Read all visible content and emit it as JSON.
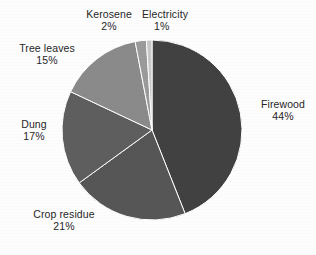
{
  "chart_data": {
    "type": "pie",
    "title": "",
    "subtitle": "",
    "xlabel": "",
    "ylabel": "",
    "legend_position": "none",
    "grid": false,
    "labels_outside": true,
    "unit": "%",
    "start_angle_deg": 0,
    "direction": "clockwise",
    "categories": [
      "Firewood",
      "Crop residue",
      "Dung",
      "Tree leaves",
      "Kerosene",
      "Electricity"
    ],
    "values": [
      44,
      21,
      17,
      15,
      2,
      1
    ],
    "slices": [
      {
        "label": "Firewood",
        "value": 44,
        "value_text": "44%",
        "color": "#414141"
      },
      {
        "label": "Crop residue",
        "value": 21,
        "value_text": "21%",
        "color": "#565656"
      },
      {
        "label": "Dung",
        "value": 17,
        "value_text": "17%",
        "color": "#5e5e5e"
      },
      {
        "label": "Tree leaves",
        "value": 15,
        "value_text": "15%",
        "color": "#8a8a8a"
      },
      {
        "label": "Kerosene",
        "value": 2,
        "value_text": "2%",
        "color": "#9a9a9a"
      },
      {
        "label": "Electricity",
        "value": 1,
        "value_text": "1%",
        "color": "#c8c8c8"
      }
    ]
  },
  "labels": {
    "firewood": {
      "name": "Firewood",
      "percent": "44%"
    },
    "crop_residue": {
      "name": "Crop residue",
      "percent": "21%"
    },
    "dung": {
      "name": "Dung",
      "percent": "17%"
    },
    "tree_leaves": {
      "name": "Tree leaves",
      "percent": "15%"
    },
    "kerosene": {
      "name": "Kerosene",
      "percent": "2%"
    },
    "electricity": {
      "name": "Electricity",
      "percent": "1%"
    }
  },
  "style": {
    "background": "#fdfdfd",
    "text_color": "#262626",
    "slice_gap_color": "#ffffff"
  }
}
